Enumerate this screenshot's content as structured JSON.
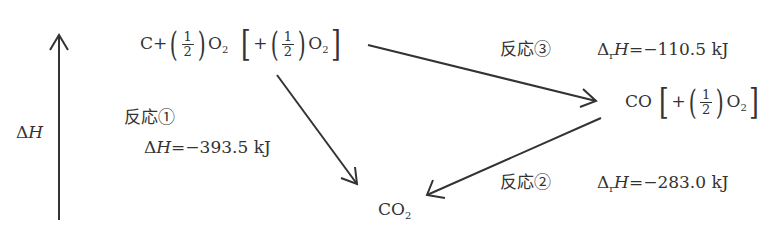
{
  "axis": {
    "label_delta": "Δ",
    "label_H": "H"
  },
  "top_species": {
    "main": "C+",
    "frac_num": "1",
    "frac_den": "2",
    "o2": "O",
    "o2_sub": "2",
    "bracket_plus": "+",
    "bracket_num": "1",
    "bracket_den": "2",
    "bracket_o2": "O",
    "bracket_o2_sub": "2"
  },
  "middle_species": {
    "main": "CO",
    "bracket_plus": "+",
    "frac_num": "1",
    "frac_den": "2",
    "o2": "O",
    "o2_sub": "2"
  },
  "bottom_species": {
    "main": "CO",
    "sub": "2"
  },
  "reactions": [
    {
      "id": "reaction-1",
      "label": "反応①",
      "delta": "Δ",
      "sub": "",
      "H": "H",
      "eq": "=−393.5 kJ"
    },
    {
      "id": "reaction-2",
      "label": "反応②",
      "delta": "Δ",
      "sub": "r",
      "H": "H",
      "eq": "=−283.0 kJ"
    },
    {
      "id": "reaction-3",
      "label": "反応③",
      "delta": "Δ",
      "sub": "r",
      "H": "H",
      "eq": "=−110.5 kJ"
    }
  ],
  "colors": {
    "ink": "#333333",
    "background": "#ffffff"
  }
}
